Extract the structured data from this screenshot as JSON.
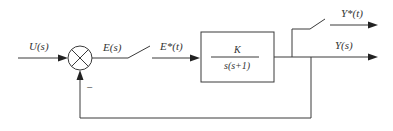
{
  "diagram": {
    "type": "sampled-data feedback control block diagram",
    "input_label": "U(s)",
    "error_label": "E(s)",
    "sampled_error_label": "E*(t)",
    "plant": {
      "numerator": "K",
      "denominator": "s(s+1)"
    },
    "output_label": "Y(s)",
    "sampled_output_label": "Y*(t)",
    "feedback_sign": "−",
    "colors": {
      "line": "#3a3a3a",
      "text": "#333333",
      "background": "#ffffff"
    }
  }
}
